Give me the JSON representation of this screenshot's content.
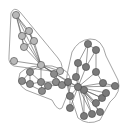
{
  "diagram": {
    "type": "network-graph-with-community-hulls",
    "colors": {
      "background": "#ffffff",
      "edge": "#555555",
      "hull": "#9a9a9a",
      "group_light": "#b8b8b8",
      "group_mid": "#8a8a8a",
      "group_dark": "#7a7a7a",
      "node_stroke": "#444444"
    },
    "hulls": [
      {
        "id": "A",
        "path": "M11,13 Q14,6 20,12 L58,58 Q66,68 58,72 L14,66 Q8,64 9,56 Z"
      },
      {
        "id": "B",
        "path": "M20,73 Q28,64 52,66 L64,70 Q72,74 70,88 L62,108 Q58,112 52,100 L26,90 Q16,84 20,73 Z"
      },
      {
        "id": "C",
        "path": "M72,52 Q78,40 90,39 Q102,38 106,56 L118,80 Q122,92 110,102 L100,120 Q88,126 78,118 L72,100 Q64,84 68,70 Z"
      }
    ],
    "nodes": [
      {
        "id": 1,
        "x": 16,
        "y": 15,
        "group": "light"
      },
      {
        "id": 2,
        "x": 22,
        "y": 36,
        "group": "light"
      },
      {
        "id": 3,
        "x": 29,
        "y": 31,
        "group": "light"
      },
      {
        "id": 4,
        "x": 24,
        "y": 47,
        "group": "light"
      },
      {
        "id": 5,
        "x": 34,
        "y": 41,
        "group": "light"
      },
      {
        "id": 6,
        "x": 14,
        "y": 61,
        "group": "light"
      },
      {
        "id": 7,
        "x": 41,
        "y": 65,
        "group": "light"
      },
      {
        "id": 8,
        "x": 60,
        "y": 71,
        "group": "light"
      },
      {
        "id": 9,
        "x": 30,
        "y": 72,
        "group": "mid"
      },
      {
        "id": 10,
        "x": 22,
        "y": 81,
        "group": "mid"
      },
      {
        "id": 11,
        "x": 30,
        "y": 84,
        "group": "mid"
      },
      {
        "id": 12,
        "x": 41,
        "y": 82,
        "group": "mid"
      },
      {
        "id": 13,
        "x": 42,
        "y": 91,
        "group": "mid"
      },
      {
        "id": 14,
        "x": 48,
        "y": 86,
        "group": "mid"
      },
      {
        "id": 15,
        "x": 56,
        "y": 82,
        "group": "mid"
      },
      {
        "id": 16,
        "x": 62,
        "y": 85,
        "group": "mid"
      },
      {
        "id": 17,
        "x": 54,
        "y": 74,
        "group": "mid"
      },
      {
        "id": 18,
        "x": 88,
        "y": 44,
        "group": "dark"
      },
      {
        "id": 19,
        "x": 96,
        "y": 50,
        "group": "dark"
      },
      {
        "id": 20,
        "x": 78,
        "y": 63,
        "group": "dark"
      },
      {
        "id": 21,
        "x": 86,
        "y": 67,
        "group": "dark"
      },
      {
        "id": 22,
        "x": 76,
        "y": 77,
        "group": "dark"
      },
      {
        "id": 23,
        "x": 96,
        "y": 72,
        "group": "dark"
      },
      {
        "id": 24,
        "x": 68,
        "y": 82,
        "group": "dark"
      },
      {
        "id": 25,
        "x": 84,
        "y": 90,
        "group": "dark"
      },
      {
        "id": 26,
        "x": 78,
        "y": 87,
        "group": "dark"
      },
      {
        "id": 27,
        "x": 103,
        "y": 83,
        "group": "dark"
      },
      {
        "id": 28,
        "x": 115,
        "y": 86,
        "group": "dark"
      },
      {
        "id": 29,
        "x": 70,
        "y": 96,
        "group": "dark"
      },
      {
        "id": 30,
        "x": 102,
        "y": 98,
        "group": "dark"
      },
      {
        "id": 31,
        "x": 106,
        "y": 93,
        "group": "dark"
      },
      {
        "id": 32,
        "x": 96,
        "y": 103,
        "group": "dark"
      },
      {
        "id": 33,
        "x": 70,
        "y": 108,
        "group": "dark"
      },
      {
        "id": 34,
        "x": 92,
        "y": 114,
        "group": "dark"
      },
      {
        "id": 35,
        "x": 84,
        "y": 116,
        "group": "dark"
      },
      {
        "id": 36,
        "x": 100,
        "y": 112,
        "group": "dark"
      }
    ],
    "edges": [
      [
        1,
        2
      ],
      [
        1,
        3
      ],
      [
        1,
        4
      ],
      [
        1,
        5
      ],
      [
        2,
        3
      ],
      [
        2,
        4
      ],
      [
        3,
        5
      ],
      [
        4,
        5
      ],
      [
        1,
        7
      ],
      [
        2,
        7
      ],
      [
        3,
        7
      ],
      [
        4,
        7
      ],
      [
        5,
        7
      ],
      [
        6,
        7
      ],
      [
        7,
        8
      ],
      [
        7,
        9
      ],
      [
        7,
        17
      ],
      [
        7,
        12
      ],
      [
        7,
        26
      ],
      [
        7,
        24
      ],
      [
        9,
        10
      ],
      [
        9,
        11
      ],
      [
        9,
        12
      ],
      [
        10,
        11
      ],
      [
        11,
        12
      ],
      [
        12,
        13
      ],
      [
        12,
        14
      ],
      [
        13,
        14
      ],
      [
        14,
        15
      ],
      [
        15,
        16
      ],
      [
        15,
        17
      ],
      [
        16,
        17
      ],
      [
        12,
        15
      ],
      [
        14,
        16
      ],
      [
        16,
        24
      ],
      [
        16,
        26
      ],
      [
        8,
        17
      ],
      [
        10,
        13
      ],
      [
        18,
        19
      ],
      [
        18,
        20
      ],
      [
        18,
        21
      ],
      [
        19,
        21
      ],
      [
        19,
        23
      ],
      [
        20,
        21
      ],
      [
        20,
        22
      ],
      [
        20,
        26
      ],
      [
        21,
        26
      ],
      [
        22,
        26
      ],
      [
        22,
        24
      ],
      [
        23,
        26
      ],
      [
        23,
        27
      ],
      [
        24,
        26
      ],
      [
        25,
        26
      ],
      [
        26,
        27
      ],
      [
        26,
        28
      ],
      [
        26,
        29
      ],
      [
        26,
        30
      ],
      [
        26,
        31
      ],
      [
        26,
        32
      ],
      [
        26,
        33
      ],
      [
        26,
        34
      ],
      [
        26,
        35
      ],
      [
        26,
        36
      ],
      [
        25,
        34
      ],
      [
        25,
        35
      ],
      [
        25,
        36
      ],
      [
        25,
        30
      ],
      [
        25,
        32
      ],
      [
        29,
        24
      ],
      [
        33,
        29
      ],
      [
        27,
        28
      ],
      [
        30,
        31
      ]
    ]
  }
}
